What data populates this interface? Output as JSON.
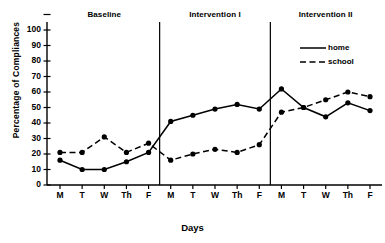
{
  "chart_data": {
    "type": "line",
    "title": "",
    "xlabel": "Days",
    "ylabel": "Percentage of Compliances",
    "ylim": [
      0,
      100
    ],
    "ytick_labels": [
      "0",
      "10",
      "20",
      "30",
      "40",
      "50",
      "60",
      "70",
      "80",
      "90",
      "100"
    ],
    "ytick_values": [
      0,
      10,
      20,
      30,
      40,
      50,
      60,
      70,
      80,
      90,
      100
    ],
    "grid": false,
    "legend_position": "top-right",
    "categories": [
      "M",
      "T",
      "W",
      "Th",
      "F",
      "M",
      "T",
      "W",
      "Th",
      "F",
      "M",
      "T",
      "W",
      "Th",
      "F"
    ],
    "x": [
      1,
      2,
      3,
      4,
      5,
      6,
      7,
      8,
      9,
      10,
      11,
      12,
      13,
      14,
      15
    ],
    "phases": [
      {
        "label": "Baseline",
        "days": [
          "M",
          "T",
          "W",
          "Th",
          "F"
        ],
        "start": 1,
        "end": 5
      },
      {
        "label": "Intervention I",
        "days": [
          "M",
          "T",
          "W",
          "Th",
          "F"
        ],
        "start": 6,
        "end": 10
      },
      {
        "label": "Intervention II",
        "days": [
          "M",
          "T",
          "W",
          "Th",
          "F"
        ],
        "start": 11,
        "end": 15
      }
    ],
    "series": [
      {
        "name": "home",
        "style": "solid",
        "marker": "filled-circle",
        "color": "#000000",
        "values": [
          16,
          10,
          10,
          15,
          21,
          41,
          45,
          49,
          52,
          49,
          62,
          50,
          44,
          53,
          48
        ]
      },
      {
        "name": "school",
        "style": "dashed",
        "marker": "filled-circle",
        "color": "#000000",
        "values": [
          21,
          21,
          31,
          21,
          27,
          16,
          20,
          23,
          21,
          26,
          47,
          50,
          55,
          60,
          57
        ]
      }
    ]
  },
  "legend": {
    "items": [
      {
        "label": "home",
        "style": "solid"
      },
      {
        "label": "school",
        "style": "dashed"
      }
    ]
  }
}
